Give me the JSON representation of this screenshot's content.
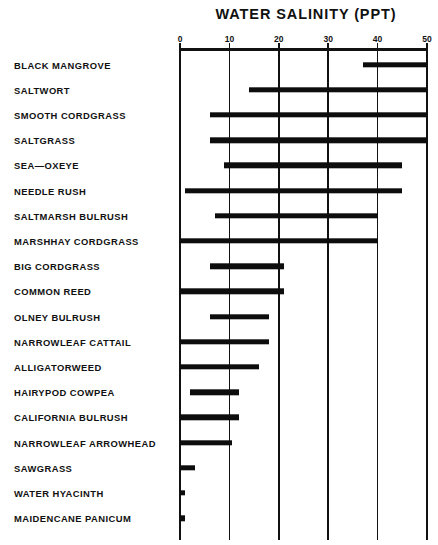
{
  "chart_data": {
    "type": "bar",
    "orientation": "horizontal",
    "bar_style": "range",
    "title": "WATER SALINITY (PPT)",
    "xlabel": "",
    "ylabel": "",
    "xlim": [
      0,
      50
    ],
    "xticks": [
      0,
      10,
      20,
      30,
      40,
      50
    ],
    "xtick_labels": [
      "0",
      "10",
      "20",
      "30",
      "40",
      "50"
    ],
    "grid": "vertical",
    "legend": "none",
    "categories": [
      "BLACK MANGROVE",
      "SALTWORT",
      "SMOOTH CORDGRASS",
      "SALTGRASS",
      "SEA—OXEYE",
      "NEEDLE RUSH",
      "SALTMARSH BULRUSH",
      "MARSHHAY CORDGRASS",
      "BIG CORDGRASS",
      "COMMON REED",
      "OLNEY BULRUSH",
      "NARROWLEAF CATTAIL",
      "ALLIGATORWEED",
      "HAIRYPOD COWPEA",
      "CALIFORNIA BULRUSH",
      "NARROWLEAF ARROWHEAD",
      "SAWGRASS",
      "WATER HYACINTH",
      "MAIDENCANE PANICUM"
    ],
    "ranges": [
      [
        37,
        50
      ],
      [
        14,
        50
      ],
      [
        6,
        50
      ],
      [
        6,
        50
      ],
      [
        9,
        45
      ],
      [
        1,
        45
      ],
      [
        7,
        40
      ],
      [
        0,
        40
      ],
      [
        6,
        21
      ],
      [
        0,
        21
      ],
      [
        6,
        18
      ],
      [
        0,
        18
      ],
      [
        0,
        16
      ],
      [
        2,
        12
      ],
      [
        0,
        12
      ],
      [
        0,
        10.5
      ],
      [
        0,
        3
      ],
      [
        0,
        1
      ],
      [
        0,
        1
      ]
    ],
    "series": [
      {
        "name": "Salinity tolerance range (ppt)",
        "low": [
          37,
          14,
          6,
          6,
          9,
          1,
          7,
          0,
          6,
          0,
          6,
          0,
          0,
          2,
          0,
          0,
          0,
          0,
          0
        ],
        "high": [
          50,
          50,
          50,
          50,
          45,
          45,
          40,
          40,
          21,
          21,
          18,
          18,
          16,
          12,
          12,
          10.5,
          3,
          1,
          1
        ]
      }
    ],
    "bar_color": "#0d0d0d",
    "axis_color": "#111111"
  }
}
